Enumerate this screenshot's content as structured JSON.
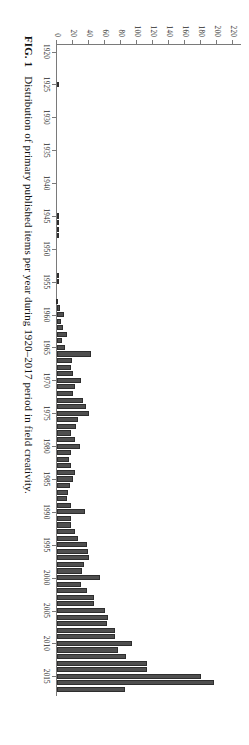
{
  "caption": {
    "figure_label": "FIG. 1",
    "text": "Distribution of primary published items per year during 1920–2017 period in field creativity."
  },
  "chart_data": {
    "type": "bar",
    "title": "",
    "xlabel": "",
    "ylabel": "",
    "orientation": "vertical-bars-rendered-rotated",
    "grid": false,
    "legend": null,
    "ylim": [
      0,
      230
    ],
    "ytick_labels": [
      "0",
      "20",
      "40",
      "60",
      "80",
      "100",
      "120",
      "140",
      "160",
      "180",
      "200",
      "220"
    ],
    "ytick_values": [
      0,
      20,
      40,
      60,
      80,
      100,
      120,
      140,
      160,
      180,
      200,
      220
    ],
    "xtick_labels": [
      "1920",
      "1925",
      "1930",
      "1935",
      "1940",
      "1945",
      "1950",
      "1955",
      "1960",
      "1965",
      "1970",
      "1975",
      "1980",
      "1985",
      "1990",
      "1995",
      "2000",
      "2005",
      "2010",
      "2015"
    ],
    "xtick_values": [
      1920,
      1925,
      1930,
      1935,
      1940,
      1945,
      1950,
      1955,
      1960,
      1965,
      1970,
      1975,
      1980,
      1985,
      1990,
      1995,
      2000,
      2005,
      2010,
      2015
    ],
    "xlim": [
      1919,
      2018
    ],
    "bar_color": "#4f4f4f",
    "categories": [
      1920,
      1921,
      1922,
      1923,
      1924,
      1925,
      1926,
      1927,
      1928,
      1929,
      1930,
      1931,
      1932,
      1933,
      1934,
      1935,
      1936,
      1937,
      1938,
      1939,
      1940,
      1941,
      1942,
      1943,
      1944,
      1945,
      1946,
      1947,
      1948,
      1949,
      1950,
      1951,
      1952,
      1953,
      1954,
      1955,
      1956,
      1957,
      1958,
      1959,
      1960,
      1961,
      1962,
      1963,
      1964,
      1965,
      1966,
      1967,
      1968,
      1969,
      1970,
      1971,
      1972,
      1973,
      1974,
      1975,
      1976,
      1977,
      1978,
      1979,
      1980,
      1981,
      1982,
      1983,
      1984,
      1985,
      1986,
      1987,
      1988,
      1989,
      1990,
      1991,
      1992,
      1993,
      1994,
      1995,
      1996,
      1997,
      1998,
      1999,
      2000,
      2001,
      2002,
      2003,
      2004,
      2005,
      2006,
      2007,
      2008,
      2009,
      2010,
      2011,
      2012,
      2013,
      2014,
      2015,
      2016,
      2017
    ],
    "values": [
      0,
      0,
      0,
      0,
      0,
      2,
      0,
      0,
      0,
      0,
      0,
      0,
      0,
      0,
      0,
      0,
      0,
      0,
      0,
      0,
      0,
      0,
      0,
      0,
      0,
      3,
      3,
      3,
      3,
      0,
      0,
      0,
      0,
      0,
      2,
      2,
      0,
      0,
      1,
      4,
      9,
      5,
      8,
      13,
      6,
      10,
      42,
      19,
      18,
      20,
      30,
      22,
      20,
      33,
      36,
      40,
      26,
      24,
      18,
      22,
      29,
      17,
      15,
      18,
      22,
      20,
      16,
      14,
      12,
      18,
      35,
      18,
      18,
      22,
      26,
      37,
      39,
      40,
      34,
      31,
      54,
      30,
      38,
      46,
      46,
      60,
      64,
      62,
      72,
      72,
      94,
      76,
      86,
      112,
      112,
      180,
      196,
      85
    ]
  }
}
